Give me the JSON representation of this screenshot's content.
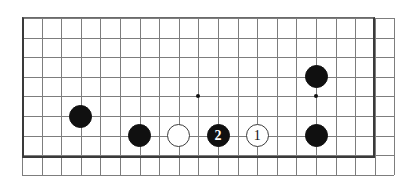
{
  "figure": {
    "kind": "go-board-diagram",
    "background_color": "#ffffff",
    "board_color": "#ffffff",
    "line_color": "#7d7d7d",
    "border_color": "#3a3a3a",
    "black_color": "#101010",
    "white_color": "#ffffff"
  },
  "board": {
    "origin_x": 22,
    "origin_y": 18,
    "cell": 19.6,
    "columns": 19,
    "rows": 8,
    "left_px": 22,
    "top_px": 17,
    "width_px": 353,
    "height_px": 141
  },
  "star_points": [
    {
      "name": "star-point-left",
      "col": 9,
      "row": 4
    },
    {
      "name": "star-point-right",
      "col": 15,
      "row": 4
    }
  ],
  "stones": [
    {
      "name": "black-stone-a",
      "color": "black",
      "col": 3,
      "row": 5,
      "label": ""
    },
    {
      "name": "black-stone-b",
      "color": "black",
      "col": 6,
      "row": 6,
      "label": ""
    },
    {
      "name": "white-stone-a",
      "color": "white",
      "col": 8,
      "row": 6,
      "label": ""
    },
    {
      "name": "black-stone-move-2",
      "color": "black",
      "col": 10,
      "row": 6,
      "label": "2"
    },
    {
      "name": "white-stone-move-1",
      "color": "white",
      "col": 12,
      "row": 6,
      "label": "1"
    },
    {
      "name": "black-stone-c",
      "color": "black",
      "col": 15,
      "row": 3,
      "label": ""
    },
    {
      "name": "black-stone-d",
      "color": "black",
      "col": 15,
      "row": 6,
      "label": ""
    }
  ],
  "move_labels": {
    "move_one": "1",
    "move_two": "2"
  }
}
